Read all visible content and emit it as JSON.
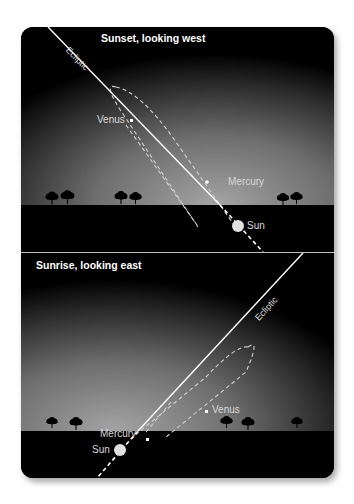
{
  "top_panel": {
    "title": "Sunset, looking west",
    "ecliptic_label": "Ecliptic",
    "planets": [
      {
        "name": "Venus"
      },
      {
        "name": "Mercury"
      }
    ],
    "sun_label": "Sun"
  },
  "bottom_panel": {
    "title": "Sunrise, looking east",
    "ecliptic_label": "Ecliptic",
    "planets": [
      {
        "name": "Mercury"
      },
      {
        "name": "Venus"
      }
    ],
    "sun_label": "Sun"
  },
  "colors": {
    "sky_dark": "#000000",
    "sky_glow": "#8a8a8a",
    "ground": "#000000",
    "line": "#ffffff",
    "orbit_dash": "#cfcfcf",
    "sun": "#e0e0e0"
  }
}
